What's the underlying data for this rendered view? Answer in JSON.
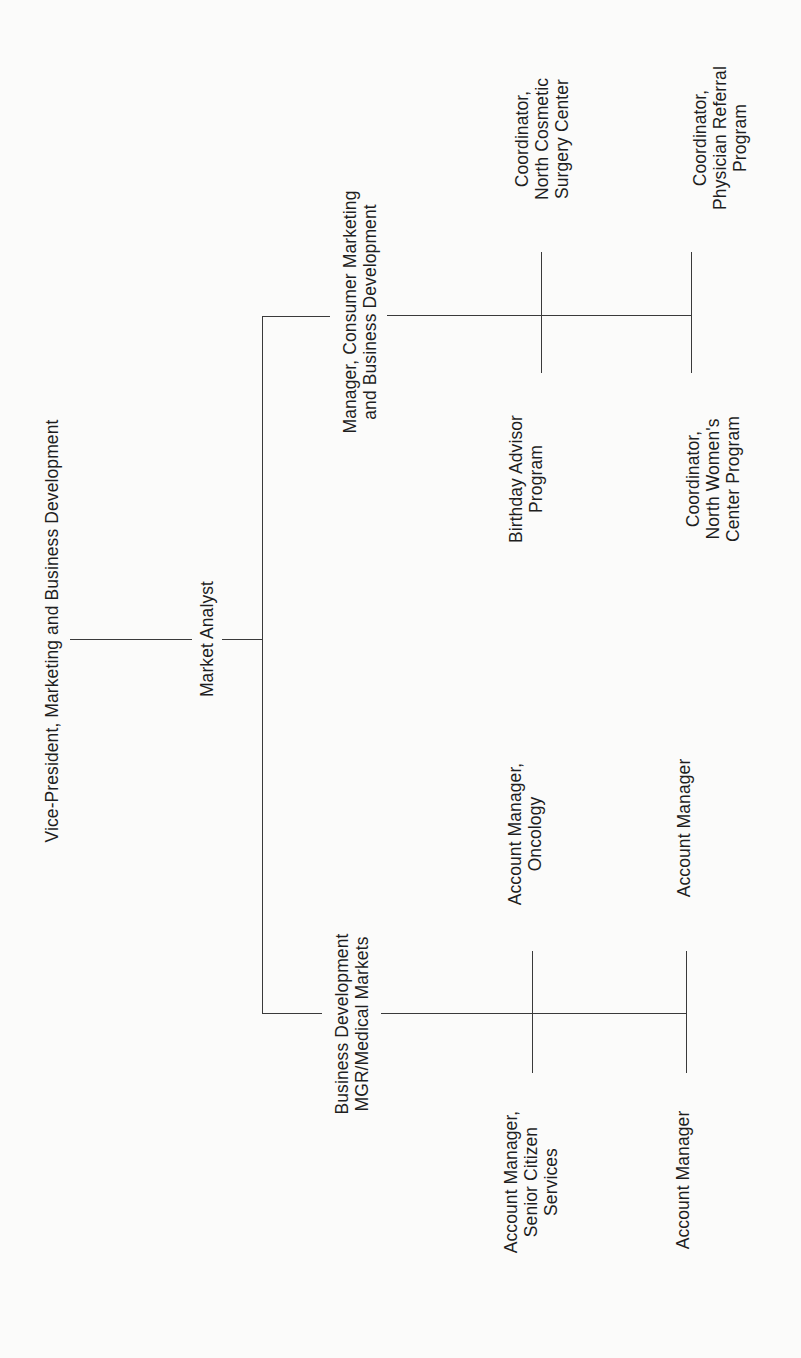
{
  "chart": {
    "type": "org-chart",
    "orientation": "rotated-90-ccw",
    "root": {
      "id": "vp",
      "lines": [
        "Vice-President, Marketing and Business Development"
      ],
      "children": [
        {
          "id": "market-analyst",
          "lines": [
            "Market Analyst"
          ],
          "children": [
            {
              "id": "mgr-consumer",
              "lines": [
                "Manager, Consumer Marketing",
                "and Business Development"
              ],
              "children": [
                {
                  "id": "coord-cosmetic",
                  "lines": [
                    "Coordinator,",
                    "North Cosmetic",
                    "Surgery Center"
                  ]
                },
                {
                  "id": "birthday",
                  "lines": [
                    "Birthday Advisor",
                    "Program"
                  ]
                },
                {
                  "id": "coord-physician",
                  "lines": [
                    "Coordinator,",
                    "Physician Referral",
                    "Program"
                  ]
                },
                {
                  "id": "coord-womens",
                  "lines": [
                    "Coordinator,",
                    "North Women's",
                    "Center Program"
                  ]
                }
              ]
            },
            {
              "id": "bd-medical",
              "lines": [
                "Business Development",
                "MGR/Medical Markets"
              ],
              "children": [
                {
                  "id": "am-oncology",
                  "lines": [
                    "Account Manager,",
                    "Oncology"
                  ]
                },
                {
                  "id": "am-senior",
                  "lines": [
                    "Account Manager,",
                    "Senior Citizen",
                    "Services"
                  ]
                },
                {
                  "id": "am-1",
                  "lines": [
                    "Account Manager"
                  ]
                },
                {
                  "id": "am-2",
                  "lines": [
                    "Account Manager"
                  ]
                }
              ]
            }
          ]
        }
      ]
    }
  },
  "nodes": {
    "vp": {
      "l1": "Vice-President, Marketing and Business Development"
    },
    "analyst": {
      "l1": "Market Analyst"
    },
    "mgr_consumer": {
      "l1": "Manager, Consumer Marketing",
      "l2": "and Business Development"
    },
    "coord_cosmetic": {
      "l1": "Coordinator,",
      "l2": "North Cosmetic",
      "l3": "Surgery Center"
    },
    "coord_physician": {
      "l1": "Coordinator,",
      "l2": "Physician Referral",
      "l3": "Program"
    },
    "birthday": {
      "l1": "Birthday Advisor",
      "l2": "Program"
    },
    "coord_womens": {
      "l1": "Coordinator,",
      "l2": "North Women's",
      "l3": "Center Program"
    },
    "bd_medical": {
      "l1": "Business Development",
      "l2": "MGR/Medical Markets"
    },
    "am_oncology": {
      "l1": "Account Manager,",
      "l2": "Oncology"
    },
    "am_right": {
      "l1": "Account Manager"
    },
    "am_senior": {
      "l1": "Account Manager,",
      "l2": "Senior Citizen",
      "l3": "Services"
    },
    "am_bottom": {
      "l1": "Account Manager"
    }
  },
  "colors": {
    "background": "#fbfbfa",
    "text": "#1e1e1e",
    "line": "#3a3a3a"
  }
}
